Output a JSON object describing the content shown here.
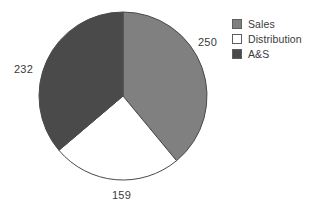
{
  "chart_data": {
    "type": "pie",
    "title": "",
    "categories": [
      "Sales",
      "Distribution",
      "A&S"
    ],
    "values": [
      250,
      159,
      232
    ],
    "labels": [
      "250",
      "159",
      "232"
    ],
    "total": 641,
    "colors": [
      "#808080",
      "#ffffff",
      "#4a4a4a"
    ],
    "start_angle_deg": 0,
    "direction": "clockwise",
    "legend_position": "right",
    "grid": false,
    "xlabel": "",
    "ylabel": ""
  },
  "legend": {
    "items": [
      {
        "label": "Sales",
        "swatch_color": "#808080",
        "swatch_name": "legend-swatch-sales"
      },
      {
        "label": "Distribution",
        "swatch_color": "#ffffff",
        "swatch_name": "legend-swatch-distribution"
      },
      {
        "label": "A&S",
        "swatch_color": "#4a4a4a",
        "swatch_name": "legend-swatch-as"
      }
    ]
  },
  "slice_labels": {
    "sales": "250",
    "as": "232",
    "distribution": "159"
  },
  "style": {
    "background": "#ffffff",
    "outline_color": "#4a4a4a",
    "text_color": "#3a3a3a"
  }
}
